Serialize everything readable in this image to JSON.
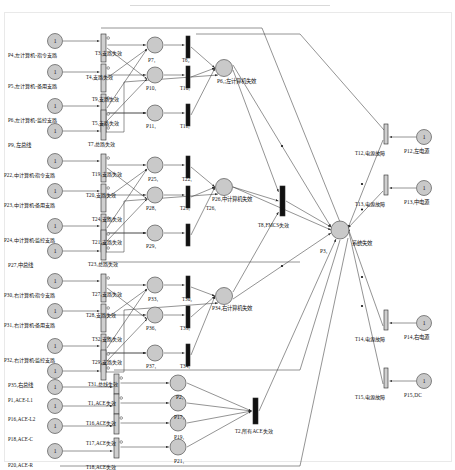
{
  "diagram": {
    "type": "petri-net",
    "title": "",
    "legend": {
      "place_shape": "circle",
      "transition_shape": "bar",
      "token_glyph": "1"
    }
  },
  "places": [
    {
      "id": "P4",
      "label": "P4₁左计算机-指令支路",
      "x": 8,
      "y": 52,
      "cx": 55,
      "cy": 41,
      "token": "1",
      "kind": "input"
    },
    {
      "id": "P5",
      "label": "P5₁左计算机-备用支路",
      "x": 8,
      "y": 83,
      "cx": 55,
      "cy": 72,
      "token": "1",
      "kind": "input"
    },
    {
      "id": "P6",
      "label": "P6₁左计算机-监控支路",
      "x": 8,
      "y": 117,
      "cx": 55,
      "cy": 106,
      "token": "1",
      "kind": "input"
    },
    {
      "id": "P9",
      "label": "P9₁左总线",
      "x": 8,
      "y": 142,
      "cx": 55,
      "cy": 131,
      "token": "1",
      "kind": "input"
    },
    {
      "id": "P22",
      "label": "P22₁中计算机-指令支路",
      "x": 4,
      "y": 172,
      "cx": 55,
      "cy": 161,
      "token": "1",
      "kind": "input"
    },
    {
      "id": "P23",
      "label": "P23₁中计算机-备用支路",
      "x": 4,
      "y": 202,
      "cx": 55,
      "cy": 191,
      "token": "1",
      "kind": "input"
    },
    {
      "id": "P24",
      "label": "P24₁中计算机-监控支路",
      "x": 4,
      "y": 237,
      "cx": 55,
      "cy": 226,
      "token": "1",
      "kind": "input"
    },
    {
      "id": "P27",
      "label": "P27₁中总线",
      "x": 8,
      "y": 262,
      "cx": 55,
      "cy": 251,
      "token": "1",
      "kind": "input"
    },
    {
      "id": "P30",
      "label": "P30₁右计算机-指令支路",
      "x": 4,
      "y": 292,
      "cx": 55,
      "cy": 281,
      "token": "1",
      "kind": "input"
    },
    {
      "id": "P31",
      "label": "P31₁右计算机-备用支路",
      "x": 4,
      "y": 322,
      "cx": 55,
      "cy": 311,
      "token": "1",
      "kind": "input"
    },
    {
      "id": "P32",
      "label": "P32₁右计算机-监控支路",
      "x": 4,
      "y": 357,
      "cx": 55,
      "cy": 346,
      "token": "1",
      "kind": "input"
    },
    {
      "id": "P35",
      "label": "P35₁右总线",
      "x": 8,
      "y": 382,
      "cx": 55,
      "cy": 371,
      "token": "1",
      "kind": "input"
    },
    {
      "id": "P1",
      "label": "P1₁ACE-L1",
      "x": 8,
      "y": 397,
      "cx": 55,
      "cy": 387,
      "token": "1",
      "kind": "input"
    },
    {
      "id": "P16",
      "label": "P16₁ACE-L2",
      "x": 8,
      "y": 416,
      "cx": 55,
      "cy": 406,
      "token": "1",
      "kind": "input"
    },
    {
      "id": "P18",
      "label": "P18₁ACE-C",
      "x": 8,
      "y": 436,
      "cx": 55,
      "cy": 426,
      "token": "1",
      "kind": "input"
    },
    {
      "id": "P20",
      "label": "P20₁ACE-R",
      "x": 8,
      "y": 462,
      "cx": 55,
      "cy": 451,
      "token": "1",
      "kind": "input"
    },
    {
      "id": "P12",
      "label": "P12₁左电源",
      "x": 404,
      "y": 148,
      "cx": 424,
      "cy": 137,
      "token": "1",
      "kind": "input"
    },
    {
      "id": "P13",
      "label": "P13₁中电源",
      "x": 404,
      "y": 199,
      "cx": 424,
      "cy": 188,
      "token": "1",
      "kind": "input"
    },
    {
      "id": "P14",
      "label": "P14₁右电源",
      "x": 404,
      "y": 334,
      "cx": 424,
      "cy": 323,
      "token": "1",
      "kind": "input"
    },
    {
      "id": "P15",
      "label": "P15₁DC",
      "x": 404,
      "y": 392,
      "cx": 424,
      "cy": 381,
      "token": "1",
      "kind": "input"
    },
    {
      "id": "P7",
      "label": "P7₁",
      "x": 148,
      "y": 57,
      "cx": 155,
      "cy": 45,
      "token": "",
      "kind": "mid"
    },
    {
      "id": "P10",
      "label": "P10₁",
      "x": 146,
      "y": 85,
      "cx": 155,
      "cy": 75,
      "token": "",
      "kind": "mid"
    },
    {
      "id": "P11",
      "label": "P11₁",
      "x": 146,
      "y": 123,
      "cx": 155,
      "cy": 113,
      "token": "",
      "kind": "mid"
    },
    {
      "id": "P25",
      "label": "P25₁",
      "x": 148,
      "y": 176,
      "cx": 155,
      "cy": 165,
      "token": "",
      "kind": "mid"
    },
    {
      "id": "P28",
      "label": "P28₁",
      "x": 146,
      "y": 205,
      "cx": 155,
      "cy": 195,
      "token": "",
      "kind": "mid"
    },
    {
      "id": "P29",
      "label": "P29₁",
      "x": 146,
      "y": 243,
      "cx": 155,
      "cy": 233,
      "token": "",
      "kind": "mid"
    },
    {
      "id": "P33",
      "label": "P33₁",
      "x": 148,
      "y": 296,
      "cx": 155,
      "cy": 285,
      "token": "",
      "kind": "mid"
    },
    {
      "id": "P36",
      "label": "P36₁",
      "x": 146,
      "y": 325,
      "cx": 155,
      "cy": 315,
      "token": "",
      "kind": "mid"
    },
    {
      "id": "P37",
      "label": "P37₁",
      "x": 146,
      "y": 363,
      "cx": 155,
      "cy": 353,
      "token": "",
      "kind": "mid"
    },
    {
      "id": "P2",
      "label": "P2₁",
      "x": 176,
      "y": 394,
      "cx": 178,
      "cy": 383,
      "token": "",
      "kind": "mid"
    },
    {
      "id": "P17",
      "label": "P17₁",
      "x": 174,
      "y": 414,
      "cx": 178,
      "cy": 403,
      "token": "",
      "kind": "mid"
    },
    {
      "id": "P19",
      "label": "P19₁",
      "x": 174,
      "y": 434,
      "cx": 178,
      "cy": 423,
      "token": "",
      "kind": "mid"
    },
    {
      "id": "P21",
      "label": "P21₁",
      "x": 174,
      "y": 458,
      "cx": 178,
      "cy": 447,
      "token": "",
      "kind": "mid"
    },
    {
      "id": "P8",
      "label": "P6₁;左计算机失效",
      "x": 217,
      "y": 78,
      "cx": 224,
      "cy": 68,
      "token": "",
      "kind": "sub"
    },
    {
      "id": "P26",
      "label": "P26₁中计算机失效",
      "x": 212,
      "y": 196,
      "cx": 224,
      "cy": 187,
      "token": "",
      "kind": "sub"
    },
    {
      "id": "P34",
      "label": "P34₁右计算机失效",
      "x": 212,
      "y": 305,
      "cx": 224,
      "cy": 296,
      "token": "",
      "kind": "sub"
    },
    {
      "id": "P3",
      "label": "P3₁",
      "x": 320,
      "y": 248,
      "cx": 340,
      "cy": 230,
      "token": "",
      "kind": "top"
    },
    {
      "id": "P3b",
      "label": "系统失效",
      "x": 352,
      "y": 240,
      "cx": 340,
      "cy": 230,
      "token": "",
      "kind": "toplabel"
    }
  ],
  "transitions": [
    {
      "id": "T3",
      "label": "T3₁支路失效",
      "x": 95,
      "y": 50,
      "bx": 101,
      "by": 34,
      "w": 5,
      "h": 28,
      "orient": "v"
    },
    {
      "id": "T4",
      "label": "T4₁支路失效",
      "x": 86,
      "y": 74,
      "bx": 101,
      "by": 64,
      "w": 5,
      "h": 28,
      "orient": "v"
    },
    {
      "id": "T9",
      "label": "T9₁支路失效",
      "x": 92,
      "y": 96,
      "bx": 101,
      "by": 94,
      "w": 5,
      "h": 28,
      "orient": "v"
    },
    {
      "id": "T5",
      "label": "T5₁支路失效",
      "x": 92,
      "y": 120,
      "bx": 101,
      "by": 110,
      "w": 5,
      "h": 22,
      "orient": "v"
    },
    {
      "id": "T7",
      "label": "T7₁总路失效",
      "x": 88,
      "y": 141,
      "bx": 101,
      "by": 124,
      "w": 5,
      "h": 16,
      "orient": "v"
    },
    {
      "id": "T19",
      "label": "T19₁支路失效",
      "x": 92,
      "y": 171,
      "bx": 101,
      "by": 154,
      "w": 5,
      "h": 28,
      "orient": "v"
    },
    {
      "id": "T20",
      "label": "T20₁支路失效",
      "x": 86,
      "y": 192,
      "bx": 101,
      "by": 184,
      "w": 5,
      "h": 28,
      "orient": "v"
    },
    {
      "id": "T24",
      "label": "T24₁支路失效",
      "x": 92,
      "y": 216,
      "bx": 101,
      "by": 214,
      "w": 5,
      "h": 28,
      "orient": "v"
    },
    {
      "id": "T21",
      "label": "T21₁支路失效",
      "x": 92,
      "y": 239,
      "bx": 101,
      "by": 230,
      "w": 5,
      "h": 22,
      "orient": "v"
    },
    {
      "id": "T23",
      "label": "T23₁总路失效",
      "x": 88,
      "y": 261,
      "bx": 101,
      "by": 244,
      "w": 5,
      "h": 16,
      "orient": "v"
    },
    {
      "id": "T27",
      "label": "T27₁支路失效",
      "x": 92,
      "y": 291,
      "bx": 101,
      "by": 274,
      "w": 5,
      "h": 28,
      "orient": "v"
    },
    {
      "id": "T28",
      "label": "T28₁支路失效",
      "x": 86,
      "y": 312,
      "bx": 101,
      "by": 304,
      "w": 5,
      "h": 28,
      "orient": "v"
    },
    {
      "id": "T32",
      "label": "T32₁支路失效",
      "x": 92,
      "y": 336,
      "bx": 101,
      "by": 334,
      "w": 5,
      "h": 28,
      "orient": "v"
    },
    {
      "id": "T29",
      "label": "T29₁支路失效",
      "x": 92,
      "y": 359,
      "bx": 101,
      "by": 350,
      "w": 5,
      "h": 22,
      "orient": "v"
    },
    {
      "id": "T31",
      "label": "T31₁总线失效",
      "x": 88,
      "y": 381,
      "bx": 101,
      "by": 364,
      "w": 5,
      "h": 16,
      "orient": "v"
    },
    {
      "id": "T1",
      "label": "T1₁ACE失效",
      "x": 88,
      "y": 400,
      "bx": 114,
      "by": 374,
      "w": 5,
      "h": 20,
      "orient": "v"
    },
    {
      "id": "T16",
      "label": "T16₁ACE失效",
      "x": 86,
      "y": 420,
      "bx": 114,
      "by": 394,
      "w": 5,
      "h": 20,
      "orient": "v"
    },
    {
      "id": "T17",
      "label": "T17₁ACE失效",
      "x": 86,
      "y": 440,
      "bx": 114,
      "by": 414,
      "w": 5,
      "h": 20,
      "orient": "v"
    },
    {
      "id": "T18",
      "label": "T18₁ACE失效",
      "x": 86,
      "y": 464,
      "bx": 114,
      "by": 438,
      "w": 5,
      "h": 20,
      "orient": "v"
    },
    {
      "id": "T6",
      "label": "T6₂",
      "x": 182,
      "y": 57,
      "bx": 186,
      "by": 36,
      "w": 4,
      "h": 22,
      "orient": "vb"
    },
    {
      "id": "T10",
      "label": "T10₁",
      "x": 180,
      "y": 85,
      "bx": 186,
      "by": 66,
      "w": 4,
      "h": 22,
      "orient": "vb"
    },
    {
      "id": "T11",
      "label": "T11₁",
      "x": 180,
      "y": 123,
      "bx": 186,
      "by": 104,
      "w": 4,
      "h": 22,
      "orient": "vb"
    },
    {
      "id": "T22",
      "label": "T22₁",
      "x": 182,
      "y": 176,
      "bx": 186,
      "by": 156,
      "w": 4,
      "h": 22,
      "orient": "vb"
    },
    {
      "id": "T25",
      "label": "T25₁",
      "x": 180,
      "y": 205,
      "bx": 186,
      "by": 186,
      "w": 4,
      "h": 22,
      "orient": "vb"
    },
    {
      "id": "T26",
      "label": "T26₁",
      "x": 206,
      "y": 205,
      "bx": 186,
      "by": 224,
      "w": 4,
      "h": 22,
      "orient": "vb"
    },
    {
      "id": "T30",
      "label": "T30₂",
      "x": 182,
      "y": 296,
      "bx": 186,
      "by": 276,
      "w": 4,
      "h": 22,
      "orient": "vb"
    },
    {
      "id": "T33",
      "label": "T33₁",
      "x": 180,
      "y": 325,
      "bx": 186,
      "by": 306,
      "w": 4,
      "h": 22,
      "orient": "vb"
    },
    {
      "id": "T34",
      "label": "T34₁",
      "x": 180,
      "y": 363,
      "bx": 186,
      "by": 344,
      "w": 4,
      "h": 22,
      "orient": "vb"
    },
    {
      "id": "T8",
      "label": "T8₁FMCS失效",
      "x": 258,
      "y": 222,
      "bx": 280,
      "by": 186,
      "w": 5,
      "h": 30,
      "orient": "vb"
    },
    {
      "id": "T2",
      "label": "T2₁所有ACE失效",
      "x": 235,
      "y": 428,
      "bx": 253,
      "by": 398,
      "w": 5,
      "h": 26,
      "orient": "vb"
    },
    {
      "id": "T12",
      "label": "T12₁电源故障",
      "x": 355,
      "y": 150,
      "bx": 384,
      "by": 124,
      "w": 4,
      "h": 20,
      "orient": "v"
    },
    {
      "id": "T13",
      "label": "T13₁电源故障",
      "x": 355,
      "y": 201,
      "bx": 384,
      "by": 175,
      "w": 4,
      "h": 20,
      "orient": "v"
    },
    {
      "id": "T14",
      "label": "T14₁电源故障",
      "x": 355,
      "y": 336,
      "bx": 384,
      "by": 310,
      "w": 4,
      "h": 20,
      "orient": "v"
    },
    {
      "id": "T15",
      "label": "T15₁电源故障",
      "x": 355,
      "y": 394,
      "bx": 384,
      "by": 368,
      "w": 4,
      "h": 20,
      "orient": "v"
    }
  ],
  "groups": [
    {
      "name": "left-computer-group",
      "label": "左计算机失效"
    },
    {
      "name": "mid-computer-group",
      "label": "中计算机失效"
    },
    {
      "name": "right-computer-group",
      "label": "右计算机失效"
    },
    {
      "name": "ace-group",
      "label": "所有ACE失效"
    },
    {
      "name": "power-group",
      "label": "电源故障"
    }
  ],
  "colors": {
    "place_fill": "#c9c9c9",
    "place_stroke": "#555555",
    "transition_open": "#cfcfcf",
    "transition_solid": "#111111",
    "arc": "#3a3a3a",
    "background": "#ffffff",
    "frame": "#e9e9e9",
    "text": "#111111"
  }
}
